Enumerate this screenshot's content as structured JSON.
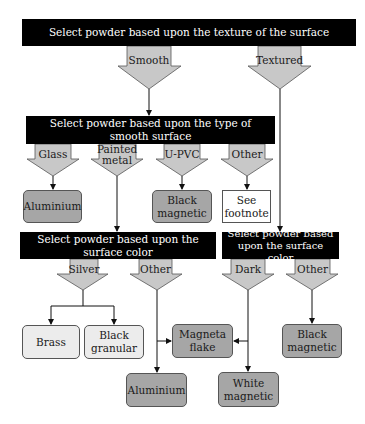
{
  "colors": {
    "bar": "#000000",
    "bar_text": "#ffffff",
    "arrow_fill": "#c8c8c8",
    "arrow_stroke": "#555555",
    "result_dark": "#a6a6a6",
    "result_light": "#ececec",
    "result_white": "#ffffff"
  },
  "decisions": {
    "texture": "Select powder based upon the texture of the surface",
    "smooth_type": "Select powder based upon the type of smooth surface",
    "smooth_color": "Select powder based upon the surface color",
    "textured_color": "Select powder based upon the surface color"
  },
  "branches": {
    "smooth": "Smooth",
    "textured": "Textured",
    "glass": "Glass",
    "painted_metal": "Painted metal",
    "upvc": "U-PVC",
    "other_smooth": "Other",
    "silver": "Silver",
    "other_color": "Other",
    "dark": "Dark",
    "other_textured": "Other"
  },
  "results": {
    "glass_result": "Aluminium",
    "upvc_result": "Black magnetic",
    "other_result": "See footnote",
    "brass": "Brass",
    "black_granular": "Black granular",
    "magneta_flake": "Magneta flake",
    "aluminium_other": "Aluminium",
    "white_magnetic": "White magnetic",
    "black_magnetic_textured": "Black magnetic"
  }
}
